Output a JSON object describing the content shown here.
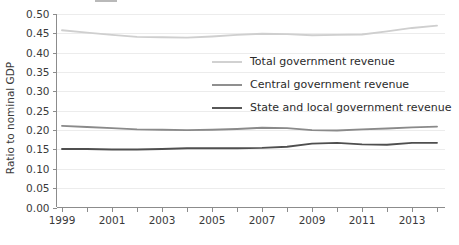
{
  "chart_data": {
    "type": "line",
    "title": "",
    "xlabel": "",
    "ylabel": "Ratio to nominal GDP",
    "ylim": [
      0.0,
      0.5
    ],
    "xlim": [
      1999,
      2014
    ],
    "grid": true,
    "legend_position": "inside-center",
    "y_ticks": [
      "0.00",
      "0.05",
      "0.10",
      "0.15",
      "0.20",
      "0.25",
      "0.30",
      "0.35",
      "0.40",
      "0.45",
      "0.50"
    ],
    "y_tick_values": [
      0.0,
      0.05,
      0.1,
      0.15,
      0.2,
      0.25,
      0.3,
      0.35,
      0.4,
      0.45,
      0.5
    ],
    "x_tick_labels": [
      "1999",
      "2001",
      "2003",
      "2005",
      "2007",
      "2009",
      "2011",
      "2013"
    ],
    "x_tick_values": [
      1999,
      2001,
      2003,
      2005,
      2007,
      2009,
      2011,
      2013
    ],
    "x_minor_ticks": [
      2000,
      2002,
      2004,
      2006,
      2008,
      2010,
      2012,
      2014
    ],
    "x": [
      1999,
      2000,
      2001,
      2002,
      2003,
      2004,
      2005,
      2006,
      2007,
      2008,
      2009,
      2010,
      2011,
      2012,
      2013,
      2014
    ],
    "series": [
      {
        "name": "Total government revenue",
        "color": "#cfcfcf",
        "width": 1.9,
        "values": [
          0.458,
          0.452,
          0.446,
          0.441,
          0.44,
          0.439,
          0.442,
          0.446,
          0.449,
          0.448,
          0.445,
          0.446,
          0.447,
          0.455,
          0.464,
          0.47
        ]
      },
      {
        "name": "Central government revenue",
        "color": "#8a8a8a",
        "width": 1.9,
        "values": [
          0.211,
          0.208,
          0.205,
          0.202,
          0.201,
          0.2,
          0.201,
          0.203,
          0.206,
          0.205,
          0.2,
          0.199,
          0.202,
          0.204,
          0.207,
          0.209
        ]
      },
      {
        "name": "State and local government revenue",
        "color": "#4f4f4f",
        "width": 1.9,
        "values": [
          0.151,
          0.151,
          0.15,
          0.15,
          0.151,
          0.153,
          0.153,
          0.153,
          0.154,
          0.157,
          0.165,
          0.167,
          0.163,
          0.162,
          0.167,
          0.167
        ]
      }
    ],
    "legend": [
      {
        "label": "Total government revenue",
        "color": "#cfcfcf"
      },
      {
        "label": "Central government revenue",
        "color": "#8a8a8a"
      },
      {
        "label": "State and local government revenue",
        "color": "#4f4f4f"
      }
    ]
  }
}
